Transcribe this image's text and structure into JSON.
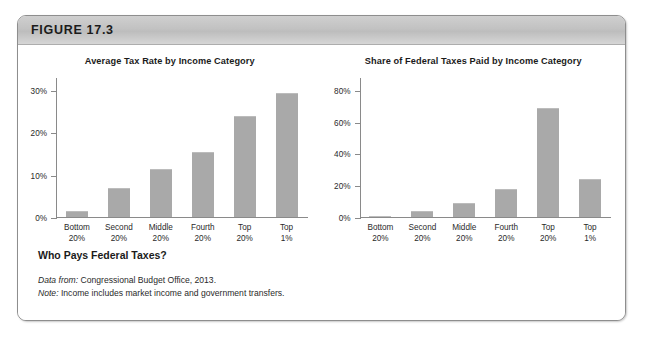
{
  "figure": {
    "label": "FIGURE 17.3",
    "caption_title": "Who Pays Federal Taxes?",
    "source_lead": "Data from:",
    "source_text": " Congressional Budget Office, 2013.",
    "note_lead": "Note:",
    "note_text": " Income includes market income and government transfers."
  },
  "chart_data": [
    {
      "type": "bar",
      "title": "Average Tax Rate by Income Category",
      "categories": [
        "Bottom 20%",
        "Second 20%",
        "Middle 20%",
        "Fourth 20%",
        "Top 20%",
        "Top 1%"
      ],
      "category_lines": [
        [
          "Bottom",
          "20%"
        ],
        [
          "Second",
          "20%"
        ],
        [
          "Middle",
          "20%"
        ],
        [
          "Fourth",
          "20%"
        ],
        [
          "Top",
          "20%"
        ],
        [
          "Top",
          "1%"
        ]
      ],
      "values": [
        1.5,
        7.0,
        11.5,
        15.5,
        24.0,
        29.5
      ],
      "xlabel": "",
      "ylabel": "",
      "ylim": [
        0,
        33
      ],
      "yticks": [
        0,
        10,
        20,
        30
      ],
      "ytick_labels": [
        "0%",
        "10%",
        "20%",
        "30%"
      ],
      "grid": false,
      "legend": "none",
      "bar_color": "#a9a9a9"
    },
    {
      "type": "bar",
      "title": "Share of Federal Taxes Paid by Income Category",
      "categories": [
        "Bottom 20%",
        "Second 20%",
        "Middle 20%",
        "Fourth 20%",
        "Top 20%",
        "Top 1%"
      ],
      "category_lines": [
        [
          "Bottom",
          "20%"
        ],
        [
          "Second",
          "20%"
        ],
        [
          "Middle",
          "20%"
        ],
        [
          "Fourth",
          "20%"
        ],
        [
          "Top",
          "20%"
        ],
        [
          "Top",
          "1%"
        ]
      ],
      "values": [
        0.5,
        3.5,
        9.0,
        17.5,
        69.0,
        24.0
      ],
      "xlabel": "",
      "ylabel": "",
      "ylim": [
        0,
        88
      ],
      "yticks": [
        0,
        20,
        40,
        60,
        80
      ],
      "ytick_labels": [
        "0%",
        "20%",
        "40%",
        "60%",
        "80%"
      ],
      "grid": false,
      "legend": "none",
      "bar_color": "#a9a9a9"
    }
  ]
}
